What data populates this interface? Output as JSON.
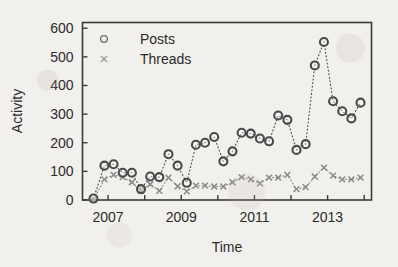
{
  "chart_data": {
    "type": "scatter",
    "title": "",
    "xlabel": "Time",
    "ylabel": "Activity",
    "xlim": [
      2006.3,
      2014.2
    ],
    "ylim": [
      0,
      620
    ],
    "yticks": [
      0,
      100,
      200,
      300,
      400,
      500,
      600
    ],
    "ytick_labels": [
      "0",
      "100",
      "200",
      "300",
      "400",
      "500",
      "600"
    ],
    "xticks": [
      2007,
      2009,
      2011,
      2013
    ],
    "xtick_labels": [
      "2007",
      "2009",
      "2011",
      "2013"
    ],
    "xminor_ticks": [
      2008,
      2010,
      2012,
      2014
    ],
    "grid": false,
    "legend_position": "top-left-inside",
    "marker_style": {
      "posts": "open-circle",
      "threads": "cross-x"
    },
    "line_style": "dotted",
    "colors": {
      "posts": "#4a4a4a",
      "threads": "#8a8a8a",
      "axis": "#2b2b2b",
      "background": "#f2f0ec"
    },
    "x": [
      2006.6,
      2006.9,
      2007.15,
      2007.4,
      2007.65,
      2007.9,
      2008.15,
      2008.4,
      2008.65,
      2008.9,
      2009.15,
      2009.4,
      2009.65,
      2009.9,
      2010.15,
      2010.4,
      2010.65,
      2010.9,
      2011.15,
      2011.4,
      2011.65,
      2011.9,
      2012.15,
      2012.4,
      2012.65,
      2012.9,
      2013.15,
      2013.4,
      2013.65,
      2013.9
    ],
    "series": [
      {
        "name": "Posts",
        "marker": "o",
        "values": [
          5,
          120,
          125,
          95,
          95,
          38,
          82,
          80,
          160,
          120,
          60,
          193,
          200,
          220,
          135,
          170,
          235,
          232,
          215,
          205,
          295,
          280,
          175,
          195,
          470,
          552,
          345,
          310,
          285,
          340
        ]
      },
      {
        "name": "Threads",
        "marker": "x",
        "values": [
          2,
          72,
          88,
          80,
          62,
          32,
          55,
          32,
          78,
          48,
          30,
          50,
          50,
          47,
          47,
          62,
          80,
          72,
          58,
          78,
          78,
          88,
          38,
          45,
          82,
          113,
          85,
          72,
          72,
          78
        ]
      }
    ]
  },
  "legend": {
    "entries": [
      {
        "label": "Posts",
        "marker": "circle"
      },
      {
        "label": "Threads",
        "marker": "x"
      }
    ]
  },
  "axes": {
    "y_title": "Activity",
    "x_title": "Time"
  }
}
